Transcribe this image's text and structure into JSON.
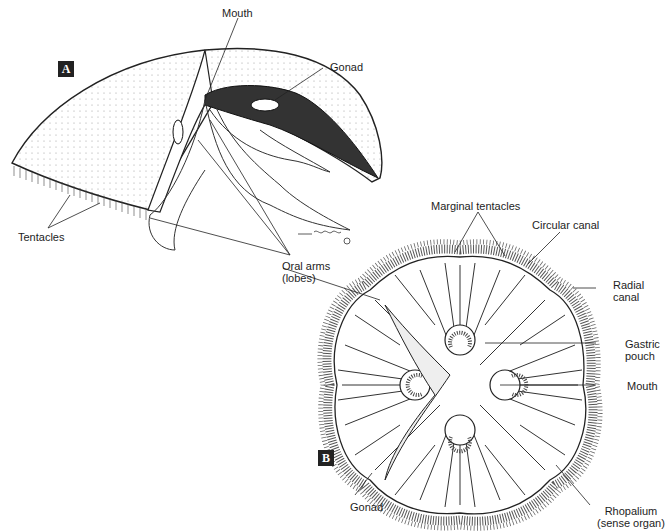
{
  "figure": {
    "panels": [
      {
        "id": "A",
        "badge": "A",
        "view": "side view of jellyfish bell"
      },
      {
        "id": "B",
        "badge": "B",
        "view": "oral view of jellyfish bell"
      }
    ],
    "panel_a": {
      "labels": {
        "mouth": "Mouth",
        "gonad": "Gonad",
        "tentacles": "Tentacles",
        "oral_arms_1": "Oral arms",
        "oral_arms_2": "(lobes)"
      },
      "signature": "Giddings ©"
    },
    "panel_b": {
      "labels": {
        "marginal_tentacles": "Marginal tentacles",
        "circular_canal": "Circular canal",
        "radial_canal_1": "Radial",
        "radial_canal_2": "canal",
        "gastric_pouch_1": "Gastric",
        "gastric_pouch_2": "pouch",
        "mouth": "Mouth",
        "rhopalium_1": "Rhopalium",
        "rhopalium_2": "(sense organ)",
        "gonad": "Gonad"
      }
    },
    "colors": {
      "ink": "#1d1d1d",
      "background": "#ffffff",
      "badge_bg": "#222222"
    }
  }
}
